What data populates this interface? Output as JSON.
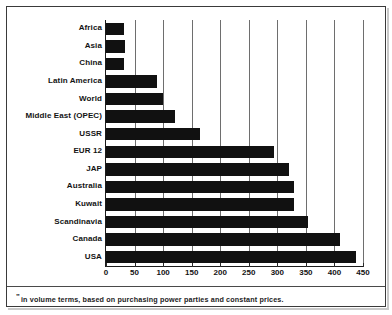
{
  "figure": {
    "footnote_mark": "\"",
    "footnote": "in volume terms, based on purchasing power parties and constant prices.",
    "bar_color": "#111111",
    "grid_color": "#6e6e6e",
    "axis_color": "#1b1b1b",
    "frame_color": "#3a3a3a"
  },
  "chart_data": {
    "type": "bar",
    "orientation": "horizontal",
    "title": "",
    "subtitle": "",
    "xlabel": "",
    "ylabel": "",
    "xlim": [
      0,
      450
    ],
    "ylim": null,
    "grid": true,
    "legend": null,
    "xticks": [
      0,
      50,
      100,
      150,
      200,
      250,
      300,
      350,
      400,
      450
    ],
    "xtick_labels": [
      "0",
      "50",
      "100",
      "150",
      "200",
      "250",
      "300",
      "350",
      "400",
      "450"
    ],
    "categories": [
      "Africa",
      "Asia",
      "China",
      "Latin America",
      "World",
      "Middle East (OPEC)",
      "USSR",
      "EUR 12",
      "JAP",
      "Australia",
      "Kuwait",
      "Scandinavia",
      "Canada",
      "USA"
    ],
    "values": [
      32,
      33,
      32,
      90,
      100,
      120,
      165,
      295,
      320,
      330,
      330,
      353,
      410,
      437
    ],
    "annotations": [
      "\" in volume terms, based on purchasing power parties and constant prices."
    ]
  }
}
